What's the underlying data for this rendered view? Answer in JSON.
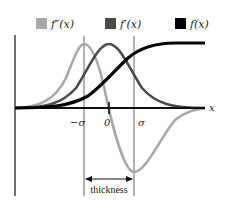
{
  "legend": {
    "items": [
      {
        "label": "f″(x)",
        "color": "#a8a8a8"
      },
      {
        "label": "f′(x)",
        "color": "#4a4a4a"
      },
      {
        "label": "f(x)",
        "color": "#000000"
      }
    ]
  },
  "axes": {
    "x_label": "x",
    "ticks": [
      "−σ",
      "0",
      "σ"
    ]
  },
  "annotation": {
    "thickness_label": "thickness"
  },
  "colors": {
    "second_derivative": "#a8a8a8",
    "first_derivative": "#4a4a4a",
    "function": "#000000",
    "background": "#ffffff"
  }
}
